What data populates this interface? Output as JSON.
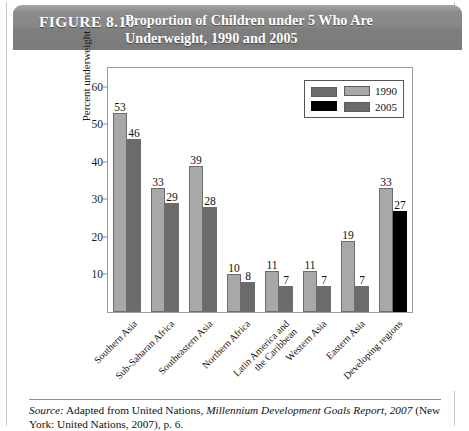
{
  "header": {
    "figure_number": "FIGURE 8.10",
    "title": "Proportion of Children under 5 Who Are Underweight, 1990 and 2005"
  },
  "source": {
    "label": "Source:",
    "text_part1": " Adapted from United Nations, ",
    "italic_title": "Millennium Development Goals Report, 2007",
    "text_part2": " (New York: United Nations, 2007), p. 6."
  },
  "legend": {
    "entries": [
      {
        "label": "1990",
        "color": "#a8a8a8"
      },
      {
        "label": "2005",
        "color": "#6b6b6b"
      }
    ],
    "extra_swatches": [
      {
        "name": "dark-gray-swatch",
        "color": "#6b6b6b"
      },
      {
        "name": "black-swatch",
        "color": "#000000"
      }
    ]
  },
  "chart_data": {
    "type": "bar",
    "title": "Proportion of Children under 5 Who Are Underweight, 1990 and 2005",
    "xlabel": "",
    "ylabel": "Percent underweight",
    "ylim": [
      0,
      65
    ],
    "yticks": [
      10,
      20,
      30,
      40,
      50,
      60
    ],
    "grid": false,
    "legend_position": "top-right",
    "categories": [
      "Southern Asia",
      "Sub-Saharan Africa",
      "Southeastern Asia",
      "Northern Africa",
      "Latin America and\nthe Caribbean",
      "Western Asia",
      "Eastern Asia",
      "Developing regions"
    ],
    "series": [
      {
        "name": "1990",
        "color": "#a8a8a8",
        "values": [
          53,
          33,
          39,
          10,
          11,
          11,
          19,
          33
        ]
      },
      {
        "name": "2005",
        "color": "#6b6b6b",
        "values": [
          46,
          29,
          28,
          8,
          7,
          7,
          7,
          27
        ],
        "value_colors": [
          "#6b6b6b",
          "#6b6b6b",
          "#6b6b6b",
          "#6b6b6b",
          "#6b6b6b",
          "#6b6b6b",
          "#6b6b6b",
          "#000000"
        ]
      }
    ]
  }
}
